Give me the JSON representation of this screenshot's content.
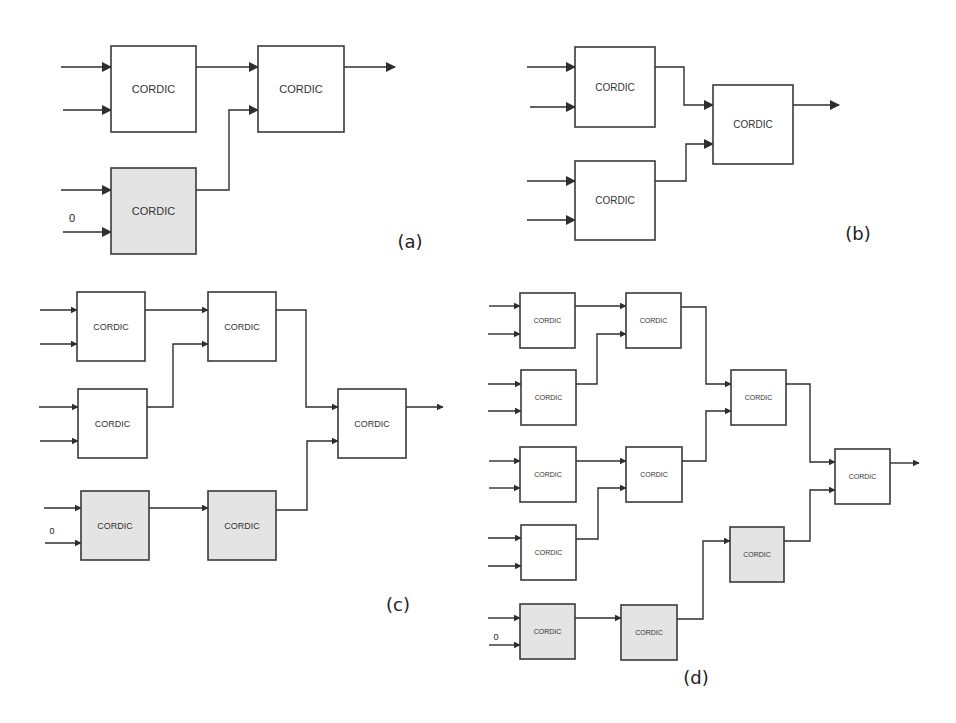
{
  "figure": {
    "block_label": "CORDIC",
    "zero_input_label": "0",
    "colors": {
      "stroke": "#3a3a3a",
      "plain_fill": "#ffffff",
      "shaded_fill": "#e4e4e4",
      "background": "#ffffff"
    },
    "panels": [
      {
        "id": "a",
        "caption": "(a)",
        "caption_pos": [
          410,
          248
        ],
        "font_size": 11,
        "blocks": [
          {
            "id": "a1",
            "x": 111,
            "y": 46,
            "w": 85,
            "h": 86,
            "shaded": false
          },
          {
            "id": "a2",
            "x": 258,
            "y": 46,
            "w": 86,
            "h": 86,
            "shaded": false
          },
          {
            "id": "a3",
            "x": 111,
            "y": 168,
            "w": 85,
            "h": 86,
            "shaded": true
          }
        ],
        "zero": {
          "x": 72,
          "y": 222
        },
        "arrows": [
          [
            [
              61,
              67
            ],
            [
              111,
              67
            ]
          ],
          [
            [
              63,
              110
            ],
            [
              111,
              110
            ]
          ],
          [
            [
              61,
              190
            ],
            [
              111,
              190
            ]
          ],
          [
            [
              63,
              232
            ],
            [
              111,
              232
            ]
          ],
          [
            [
              196,
              67
            ],
            [
              258,
              67
            ]
          ],
          [
            [
              196,
              190
            ],
            [
              229,
              190
            ],
            [
              229,
              110
            ],
            [
              258,
              110
            ]
          ],
          [
            [
              344,
              67
            ],
            [
              395,
              67
            ]
          ]
        ]
      },
      {
        "id": "b",
        "caption": "(b)",
        "caption_pos": [
          858,
          240
        ],
        "font_size": 10,
        "blocks": [
          {
            "id": "b1",
            "x": 575,
            "y": 47,
            "w": 80,
            "h": 80,
            "shaded": false
          },
          {
            "id": "b2",
            "x": 575,
            "y": 161,
            "w": 80,
            "h": 79,
            "shaded": false
          },
          {
            "id": "b3",
            "x": 713,
            "y": 85,
            "w": 80,
            "h": 79,
            "shaded": false
          }
        ],
        "arrows": [
          [
            [
              527,
              67
            ],
            [
              575,
              67
            ]
          ],
          [
            [
              530,
              107
            ],
            [
              575,
              107
            ]
          ],
          [
            [
              527,
              181
            ],
            [
              575,
              181
            ]
          ],
          [
            [
              527,
              220
            ],
            [
              575,
              220
            ]
          ],
          [
            [
              655,
              67
            ],
            [
              684,
              67
            ],
            [
              684,
              105
            ],
            [
              713,
              105
            ]
          ],
          [
            [
              655,
              181
            ],
            [
              686,
              181
            ],
            [
              686,
              144
            ],
            [
              713,
              144
            ]
          ],
          [
            [
              793,
              105
            ],
            [
              839,
              105
            ]
          ]
        ]
      },
      {
        "id": "c",
        "caption": "(c)",
        "caption_pos": [
          398,
          611
        ],
        "font_size": 9,
        "blocks": [
          {
            "id": "c1",
            "x": 77,
            "y": 292,
            "w": 68,
            "h": 69,
            "shaded": false
          },
          {
            "id": "c2",
            "x": 208,
            "y": 292,
            "w": 68,
            "h": 69,
            "shaded": false
          },
          {
            "id": "c3",
            "x": 78,
            "y": 389,
            "w": 69,
            "h": 69,
            "shaded": false
          },
          {
            "id": "c4",
            "x": 338,
            "y": 389,
            "w": 68,
            "h": 69,
            "shaded": false
          },
          {
            "id": "c5",
            "x": 81,
            "y": 491,
            "w": 68,
            "h": 69,
            "shaded": true
          },
          {
            "id": "c6",
            "x": 208,
            "y": 491,
            "w": 68,
            "h": 69,
            "shaded": true
          }
        ],
        "zero": {
          "x": 52,
          "y": 534
        },
        "arrows": [
          [
            [
              40,
              310
            ],
            [
              77,
              310
            ]
          ],
          [
            [
              40,
              344
            ],
            [
              77,
              344
            ]
          ],
          [
            [
              39,
              407
            ],
            [
              78,
              407
            ]
          ],
          [
            [
              40,
              441
            ],
            [
              78,
              441
            ]
          ],
          [
            [
              44,
              508
            ],
            [
              81,
              508
            ]
          ],
          [
            [
              45,
              543
            ],
            [
              81,
              543
            ]
          ],
          [
            [
              145,
              310
            ],
            [
              208,
              310
            ]
          ],
          [
            [
              147,
              407
            ],
            [
              173,
              407
            ],
            [
              173,
              344
            ],
            [
              208,
              344
            ]
          ],
          [
            [
              149,
              508
            ],
            [
              208,
              508
            ]
          ],
          [
            [
              276,
              310
            ],
            [
              306,
              310
            ],
            [
              306,
              407
            ],
            [
              338,
              407
            ]
          ],
          [
            [
              276,
              510
            ],
            [
              307,
              510
            ],
            [
              307,
              441
            ],
            [
              338,
              441
            ]
          ],
          [
            [
              406,
              407
            ],
            [
              443,
              407
            ]
          ]
        ]
      },
      {
        "id": "d",
        "caption": "(d)",
        "caption_pos": [
          696,
          684
        ],
        "font_size": 7,
        "blocks": [
          {
            "id": "d1",
            "x": 520,
            "y": 293,
            "w": 55,
            "h": 55,
            "shaded": false
          },
          {
            "id": "d2",
            "x": 626,
            "y": 293,
            "w": 55,
            "h": 55,
            "shaded": false
          },
          {
            "id": "d3",
            "x": 521,
            "y": 370,
            "w": 55,
            "h": 55,
            "shaded": false
          },
          {
            "id": "d4",
            "x": 731,
            "y": 370,
            "w": 55,
            "h": 55,
            "shaded": false
          },
          {
            "id": "d5",
            "x": 520,
            "y": 447,
            "w": 56,
            "h": 55,
            "shaded": false
          },
          {
            "id": "d6",
            "x": 626,
            "y": 447,
            "w": 56,
            "h": 55,
            "shaded": false
          },
          {
            "id": "d7",
            "x": 521,
            "y": 525,
            "w": 55,
            "h": 55,
            "shaded": false
          },
          {
            "id": "d8",
            "x": 835,
            "y": 449,
            "w": 55,
            "h": 55,
            "shaded": false
          },
          {
            "id": "d9",
            "x": 730,
            "y": 527,
            "w": 54,
            "h": 55,
            "shaded": true
          },
          {
            "id": "d10",
            "x": 520,
            "y": 604,
            "w": 55,
            "h": 55,
            "shaded": true
          },
          {
            "id": "d11",
            "x": 621,
            "y": 605,
            "w": 56,
            "h": 55,
            "shaded": true
          }
        ],
        "zero": {
          "x": 496,
          "y": 640
        },
        "arrows": [
          [
            [
              489,
              306
            ],
            [
              520,
              306
            ]
          ],
          [
            [
              488,
              334
            ],
            [
              520,
              334
            ]
          ],
          [
            [
              488,
              384
            ],
            [
              521,
              384
            ]
          ],
          [
            [
              488,
              411
            ],
            [
              521,
              411
            ]
          ],
          [
            [
              489,
              461
            ],
            [
              520,
              461
            ]
          ],
          [
            [
              489,
              488
            ],
            [
              520,
              488
            ]
          ],
          [
            [
              488,
              538
            ],
            [
              521,
              538
            ]
          ],
          [
            [
              488,
              566
            ],
            [
              521,
              566
            ]
          ],
          [
            [
              488,
              618
            ],
            [
              520,
              618
            ]
          ],
          [
            [
              489,
              645
            ],
            [
              520,
              645
            ]
          ],
          [
            [
              575,
              306
            ],
            [
              626,
              306
            ]
          ],
          [
            [
              576,
              384
            ],
            [
              597,
              384
            ],
            [
              597,
              334
            ],
            [
              626,
              334
            ]
          ],
          [
            [
              576,
              461
            ],
            [
              626,
              461
            ]
          ],
          [
            [
              576,
              539
            ],
            [
              598,
              539
            ],
            [
              598,
              488
            ],
            [
              626,
              488
            ]
          ],
          [
            [
              681,
              307
            ],
            [
              706,
              307
            ],
            [
              706,
              384
            ],
            [
              731,
              384
            ]
          ],
          [
            [
              682,
              461
            ],
            [
              706,
              461
            ],
            [
              706,
              411
            ],
            [
              731,
              411
            ]
          ],
          [
            [
              786,
              384
            ],
            [
              810,
              384
            ],
            [
              810,
              462
            ],
            [
              835,
              462
            ]
          ],
          [
            [
              784,
              541
            ],
            [
              810,
              541
            ],
            [
              810,
              490
            ],
            [
              835,
              490
            ]
          ],
          [
            [
              575,
              618
            ],
            [
              621,
              618
            ]
          ],
          [
            [
              677,
              619
            ],
            [
              703,
              619
            ],
            [
              703,
              541
            ],
            [
              730,
              541
            ]
          ],
          [
            [
              890,
              463
            ],
            [
              919,
              463
            ]
          ]
        ]
      }
    ]
  }
}
